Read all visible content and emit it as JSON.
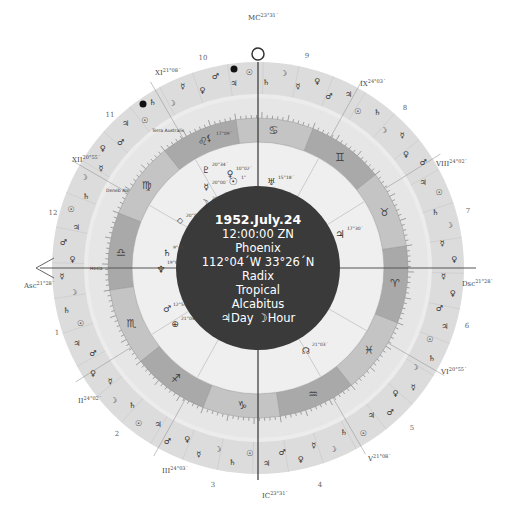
{
  "center_info": {
    "date": "1952.July.24",
    "time": "12:00:00 ZN",
    "place": "Phoenix",
    "coordinates": "112°04´W 33°26´N",
    "chart_type": "Radix",
    "zodiac": "Tropical",
    "house_system": "Alcabitus",
    "day_hour": "♃Day ☽Hour"
  },
  "angles": {
    "asc": {
      "label": "Asc",
      "degree": "21°28´"
    },
    "dsc": {
      "label": "Dsc",
      "degree": "21°28´"
    },
    "mc": {
      "label": "MC",
      "degree": "23°31´"
    },
    "ic": {
      "label": "IC",
      "degree": "23°31´"
    }
  },
  "house_cusps": [
    {
      "label": "II",
      "degree": "24°02´"
    },
    {
      "label": "III",
      "degree": "24°03´"
    },
    {
      "label": "V",
      "degree": "21°08´"
    },
    {
      "label": "VI",
      "degree": "20°55´"
    },
    {
      "label": "VIII",
      "degree": "24°02´"
    },
    {
      "label": "IX",
      "degree": "24°03´"
    },
    {
      "label": "XI",
      "degree": "21°08´"
    },
    {
      "label": "XII",
      "degree": "20°55´"
    }
  ],
  "house_numbers": [
    "1",
    "2",
    "3",
    "4",
    "5",
    "6",
    "7",
    "8",
    "9",
    "10",
    "11",
    "12"
  ],
  "signs": [
    "♈",
    "♉",
    "♊",
    "♋",
    "♌",
    "♍",
    "♎",
    "♏",
    "♐",
    "♑",
    "♒",
    "♓"
  ],
  "fixed_stars": [
    {
      "name": "Terra Australis"
    },
    {
      "name": "Deneb Ale"
    },
    {
      "name": "Hesia"
    }
  ],
  "planets": [
    {
      "name": "Sun",
      "glyph": "☉",
      "degree": "1°"
    },
    {
      "name": "Moon",
      "glyph": "☽",
      "degree": "29°"
    },
    {
      "name": "Mercury",
      "glyph": "☿",
      "degree": "20°00´"
    },
    {
      "name": "Venus",
      "glyph": "♀",
      "degree": "10°02´"
    },
    {
      "name": "Mars",
      "glyph": "♂",
      "degree": "12°59´"
    },
    {
      "name": "Jupiter",
      "glyph": "♃",
      "degree": "17°30´"
    },
    {
      "name": "Saturn",
      "glyph": "♄",
      "degree": "9°48´"
    },
    {
      "name": "Uranus",
      "glyph": "♅",
      "degree": "15°18´"
    },
    {
      "name": "Neptune",
      "glyph": "♆",
      "degree": "19°05´"
    },
    {
      "name": "Pluto",
      "glyph": "♇",
      "degree": "20°34´"
    },
    {
      "name": "North Node",
      "glyph": "☊",
      "degree": "21°03´"
    },
    {
      "name": "Lilith",
      "glyph": "⚸",
      "degree": "17°09´"
    },
    {
      "name": "Part of Fortune",
      "glyph": "⊕",
      "degree": "21°04´"
    },
    {
      "name": "Vertex",
      "glyph": "◇",
      "degree": "20°57´"
    }
  ],
  "colors": {
    "center_disc": "#3a3a3a",
    "sign_ring_dark": "#a9a9a9",
    "sign_ring_light": "#c4c4c4",
    "inner_band": "#e6e6e6",
    "outer_ring": "#dcdcdc",
    "outer_ring_light": "#ececec"
  }
}
